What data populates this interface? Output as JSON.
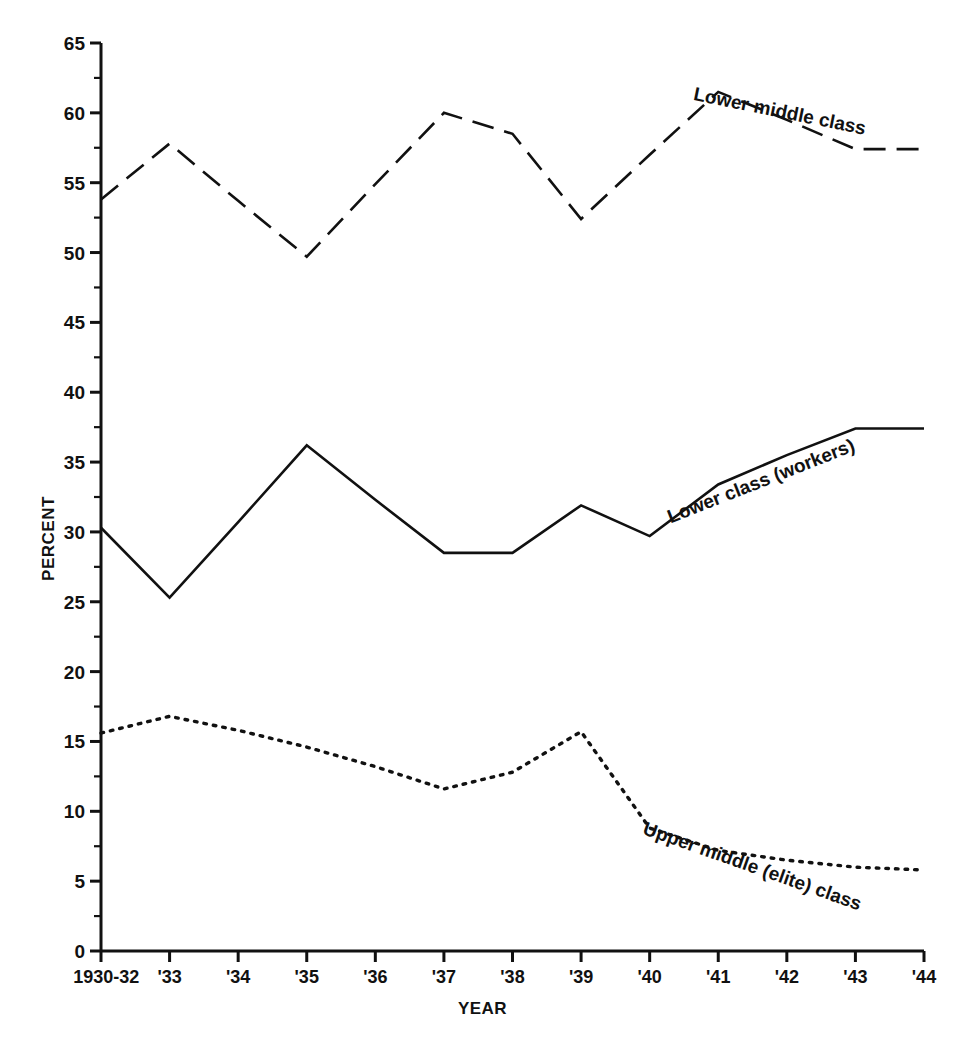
{
  "chart_data": {
    "type": "line",
    "title": "",
    "xlabel": "YEAR",
    "ylabel": "PERCENT",
    "grid": false,
    "legend_position": "inline-labels",
    "categories": [
      "1930-32",
      "'33",
      "'34",
      "'35",
      "'36",
      "'37",
      "'38",
      "'39",
      "'40",
      "'41",
      "'42",
      "'43",
      "'44"
    ],
    "ylim": [
      0,
      65
    ],
    "yticks": [
      0,
      5,
      10,
      15,
      20,
      25,
      30,
      35,
      40,
      45,
      50,
      55,
      60,
      65
    ],
    "ytick_labels": [
      "0",
      "5",
      "10",
      "15",
      "20",
      "25",
      "30",
      "35",
      "40",
      "45",
      "50",
      "55",
      "60",
      "65"
    ],
    "series": [
      {
        "name": "Lower middle class",
        "style": "dashed",
        "values": [
          53.8,
          57.8,
          53.7,
          49.7,
          54.9,
          60.0,
          58.5,
          52.4,
          57.0,
          61.5,
          59.5,
          57.4,
          57.4
        ]
      },
      {
        "name": "Lower class (workers)",
        "style": "solid",
        "values": [
          30.3,
          25.3,
          30.7,
          36.2,
          32.3,
          28.5,
          28.5,
          31.9,
          29.7,
          33.4,
          35.5,
          37.4,
          37.4
        ]
      },
      {
        "name": "Upper middle (elite) class",
        "style": "dotted",
        "values": [
          15.6,
          16.8,
          15.8,
          14.6,
          13.2,
          11.6,
          12.8,
          15.7,
          8.8,
          7.2,
          6.5,
          6.0,
          5.8
        ]
      }
    ]
  },
  "axes": {
    "ylabel": "PERCENT",
    "xlabel": "YEAR"
  },
  "series_labels": [
    {
      "text": "Lower middle class",
      "key": "lower-middle-class"
    },
    {
      "text": "Lower class (workers)",
      "key": "lower-class-workers"
    },
    {
      "text": "Upper middle (elite) class",
      "key": "upper-middle-elite-class"
    }
  ],
  "colors": {
    "ink": "#111111",
    "background": "#ffffff"
  }
}
